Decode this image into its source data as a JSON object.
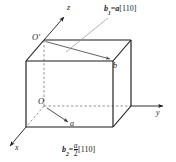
{
  "figure": {
    "type": "crystallography-unit-cell-diagram",
    "background_color": "#ffffff",
    "line_color": "#1a1a1a",
    "axes": {
      "x_label": "x",
      "y_label": "y",
      "z_label": "z"
    },
    "vertices": {
      "origin_label": "O",
      "top_origin_label": "O'",
      "point_b_label": "b"
    },
    "vectors": {
      "a_label": "a"
    },
    "annotations": {
      "b1": {
        "symbol": "b",
        "subscript": "1",
        "equals": "=",
        "coefficient": "a",
        "direction": "[110]",
        "full_text": "b1=a[110]"
      },
      "b2": {
        "symbol": "b",
        "subscript": "2",
        "equals": "=",
        "numerator": "a",
        "denominator": "2",
        "direction": "[110]",
        "full_text": "b2=(a/2)[110]"
      }
    }
  }
}
